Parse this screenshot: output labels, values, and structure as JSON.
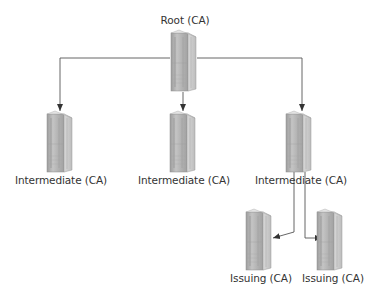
{
  "diagram": {
    "nodes": [
      {
        "id": "root",
        "label": "Root (CA)",
        "type": "server",
        "x": 184,
        "y": 33,
        "label_x": 185,
        "label_y": 12
      },
      {
        "id": "int1",
        "label": "Intermediate (CA)",
        "type": "server",
        "x": 60,
        "y": 114,
        "label_x": 61,
        "label_y": 172
      },
      {
        "id": "int2",
        "label": "Intermediate (CA)",
        "type": "server",
        "x": 183,
        "y": 114,
        "label_x": 184,
        "label_y": 172
      },
      {
        "id": "int3",
        "label": "Intermediate (CA)",
        "type": "server",
        "x": 299,
        "y": 114,
        "label_x": 301,
        "label_y": 172
      },
      {
        "id": "iss1",
        "label": "Issuing (CA)",
        "type": "server",
        "x": 259,
        "y": 212,
        "label_x": 261,
        "label_y": 270
      },
      {
        "id": "iss2",
        "label": "Issuing (CA)",
        "type": "server",
        "x": 330,
        "y": 212,
        "label_x": 333,
        "label_y": 270
      }
    ],
    "edges": [
      {
        "from": "root",
        "to": "int1"
      },
      {
        "from": "root",
        "to": "int2"
      },
      {
        "from": "root",
        "to": "int3"
      },
      {
        "from": "int3",
        "to": "iss1"
      },
      {
        "from": "int3",
        "to": "iss2"
      }
    ],
    "colors": {
      "line": "#555555",
      "server_front": "#b8b8b8",
      "server_side": "#d6d6d6",
      "server_edge": "#8a8a8a",
      "text": "#333333"
    }
  }
}
